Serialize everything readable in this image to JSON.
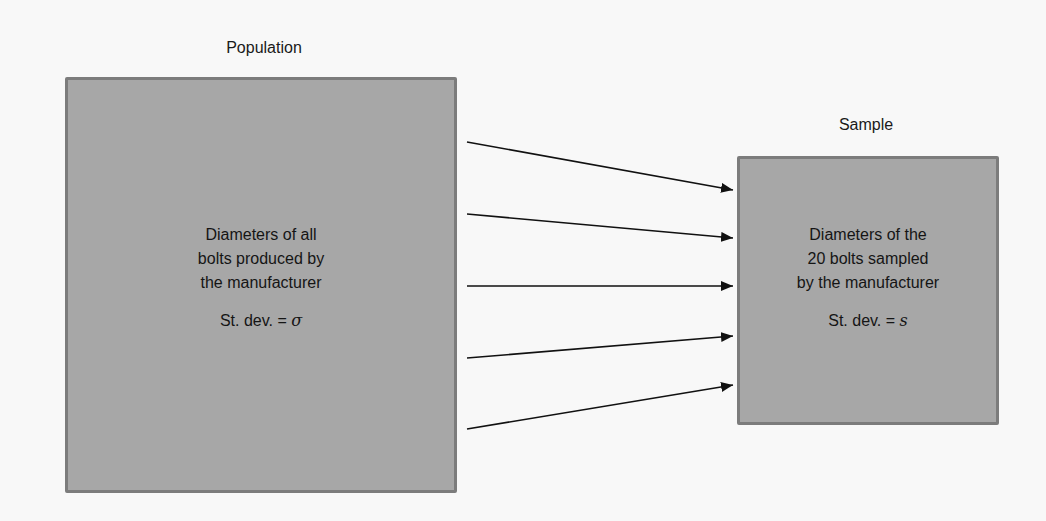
{
  "population": {
    "title": "Population",
    "lines": [
      "Diameters of all",
      "bolts produced by",
      "the manufacturer"
    ],
    "stat_label": "St. dev. = ",
    "stat_symbol": "σ"
  },
  "sample": {
    "title": "Sample",
    "lines": [
      "Diameters of the",
      "20 bolts sampled",
      "by the manufacturer"
    ],
    "stat_label": "St. dev. = ",
    "stat_symbol": "s"
  },
  "arrows": {
    "count": 5,
    "from": "population",
    "to": "sample"
  },
  "colors": {
    "background": "#f8f8f8",
    "box_fill": "#a7a7a7",
    "box_border": "#7c7c7c",
    "arrow": "#111111",
    "text": "#151515"
  }
}
